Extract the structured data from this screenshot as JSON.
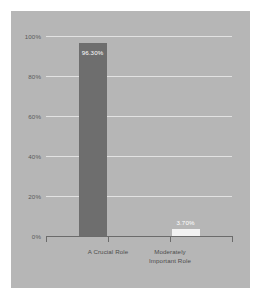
{
  "chart_data": {
    "type": "bar",
    "title": "",
    "xlabel": "",
    "ylabel": "",
    "categories": [
      "A Crucial Role",
      "Moderately\nImportant Role"
    ],
    "values": [
      96.3,
      3.7
    ],
    "value_labels": [
      "96.30%",
      "3.70%"
    ],
    "ylim": [
      0,
      100
    ],
    "yticks": [
      100,
      80,
      60,
      40,
      20,
      0
    ],
    "ytick_labels": [
      "100%",
      "80%",
      "60%",
      "40%",
      "20%",
      "0%"
    ],
    "grid": true,
    "legend": false,
    "bar_colors": [
      "#6e6e6e",
      "#f2f2f2"
    ]
  },
  "colors": {
    "page_background": "#ffffff",
    "panel_background": "#b6b6b6",
    "gridline": "#e2e2e2",
    "axis_line": "#6b6b6b",
    "tick_text": "#5a5a5a",
    "category_text": "#4d4d4d",
    "value_text": "#ffffff"
  }
}
